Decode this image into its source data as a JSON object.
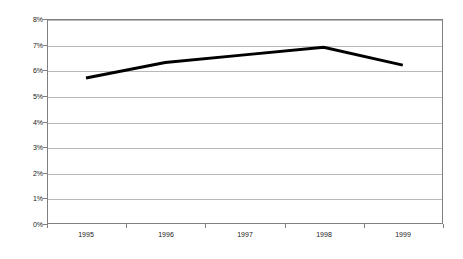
{
  "chart_data": {
    "type": "line",
    "title": "",
    "subtitle": "",
    "xlabel": "",
    "ylabel": "",
    "categories": [
      "1995",
      "1996",
      "1997",
      "1998",
      "1999"
    ],
    "values": [
      5.7,
      6.3,
      6.6,
      6.9,
      6.2
    ],
    "series": [
      {
        "name": "",
        "values": [
          5.7,
          6.3,
          6.6,
          6.9,
          6.2
        ],
        "color": "#000000",
        "line_width": 3
      }
    ],
    "y_ticks": [
      "0%",
      "1%",
      "2%",
      "3%",
      "4%",
      "5%",
      "6%",
      "7%",
      "8%"
    ],
    "y_tick_values": [
      0,
      1,
      2,
      3,
      4,
      5,
      6,
      7,
      8
    ],
    "ylim": [
      0,
      8
    ],
    "y_unit": "%",
    "x_ticks": [
      "1995",
      "1996",
      "1997",
      "1998",
      "1999"
    ],
    "grid": {
      "horizontal": true,
      "vertical": false,
      "color": "#b9b9b9"
    },
    "legend": {
      "visible": false,
      "position": "none",
      "entries": []
    },
    "frame": {
      "border_color": "#808080",
      "background": "#ffffff"
    },
    "annotations": [],
    "markers": false
  }
}
